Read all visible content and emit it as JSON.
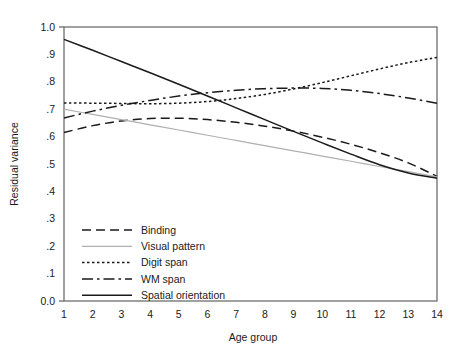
{
  "chart_data": {
    "type": "line",
    "title": "",
    "xlabel": "Age group",
    "ylabel": "Residual variance",
    "x": [
      1,
      2,
      3,
      4,
      5,
      6,
      7,
      8,
      9,
      10,
      11,
      12,
      13,
      14
    ],
    "xlim": [
      1,
      14
    ],
    "ylim": [
      0.0,
      1.0
    ],
    "xticks": [
      "1",
      "2",
      "3",
      "4",
      "5",
      "6",
      "7",
      "8",
      "9",
      "10",
      "11",
      "12",
      "13",
      "14"
    ],
    "yticks": [
      "0.0",
      ".1",
      ".2",
      ".3",
      ".4",
      ".5",
      ".6",
      ".7",
      ".8",
      ".9",
      "1.0"
    ],
    "ytick_values": [
      0.0,
      0.1,
      0.2,
      0.3,
      0.4,
      0.5,
      0.6,
      0.7,
      0.8,
      0.9,
      1.0
    ],
    "grid": false,
    "legend_position": "inside-lower-left",
    "series": [
      {
        "name": "Binding",
        "style": "dashed",
        "color": "#1a1a1a",
        "width": 1.5,
        "dash": "9,5",
        "values": [
          0.615,
          0.64,
          0.657,
          0.666,
          0.667,
          0.662,
          0.652,
          0.638,
          0.62,
          0.598,
          0.572,
          0.541,
          0.504,
          0.455
        ]
      },
      {
        "name": "Visual pattern",
        "style": "solid-light",
        "color": "#b0b0b0",
        "width": 1.2,
        "dash": "none",
        "values": [
          0.7,
          0.681,
          0.662,
          0.643,
          0.624,
          0.605,
          0.586,
          0.567,
          0.548,
          0.529,
          0.51,
          0.491,
          0.472,
          0.453
        ]
      },
      {
        "name": "Digit span",
        "style": "dotted",
        "color": "#1a1a1a",
        "width": 1.5,
        "dash": "2.5,2.5",
        "values": [
          0.723,
          0.722,
          0.721,
          0.72,
          0.722,
          0.728,
          0.739,
          0.754,
          0.774,
          0.797,
          0.822,
          0.847,
          0.87,
          0.889
        ]
      },
      {
        "name": "WM span",
        "style": "dash-dot",
        "color": "#1a1a1a",
        "width": 1.5,
        "dash": "11,4,2.5,4",
        "values": [
          0.668,
          0.693,
          0.714,
          0.732,
          0.748,
          0.76,
          0.769,
          0.775,
          0.777,
          0.776,
          0.769,
          0.757,
          0.741,
          0.722
        ]
      },
      {
        "name": "Spatial orientation",
        "style": "solid",
        "color": "#1a1a1a",
        "width": 1.5,
        "dash": "none",
        "values": [
          0.955,
          0.915,
          0.874,
          0.833,
          0.791,
          0.748,
          0.705,
          0.662,
          0.619,
          0.577,
          0.536,
          0.497,
          0.467,
          0.448
        ]
      }
    ]
  }
}
